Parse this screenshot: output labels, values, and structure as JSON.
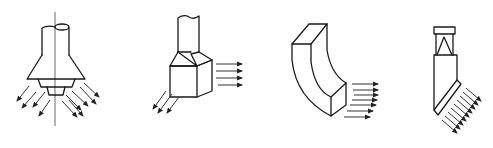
{
  "title": "Types of local exhaust / air outlet nozzles",
  "figures": [
    {
      "id": "fig-a",
      "name": "conical-multi-tier-diffuser",
      "flow_direction": "radial-downward",
      "arrow_count": 10
    },
    {
      "id": "fig-b",
      "name": "rectangular-transition-outlet",
      "flow_direction": "horizontal-and-downward",
      "arrow_count": 7
    },
    {
      "id": "fig-c",
      "name": "curved-elbow-with-mesh-outlet",
      "flow_direction": "horizontal",
      "arrow_count": 7
    },
    {
      "id": "fig-d",
      "name": "angled-slot-nozzle",
      "flow_direction": "oblique-downward",
      "arrow_count": 9
    }
  ],
  "colors": {
    "line": "#1a1a1a",
    "background": "#ffffff"
  }
}
